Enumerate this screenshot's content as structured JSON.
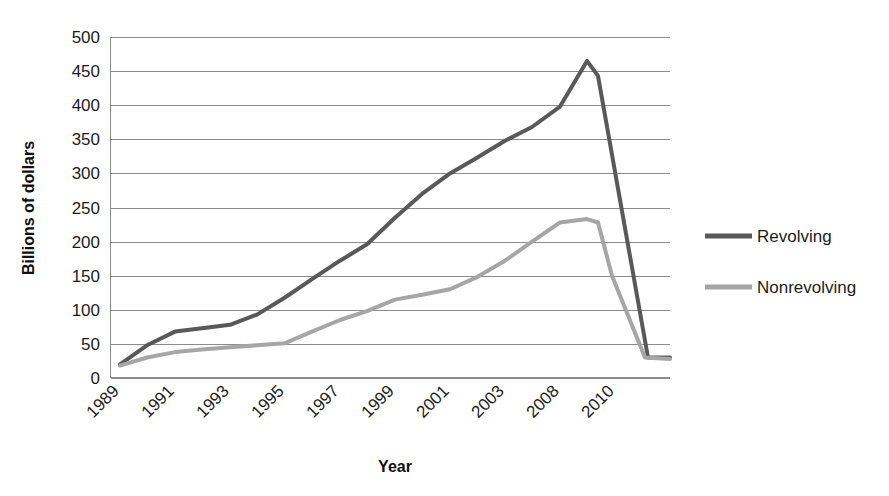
{
  "chart_data": {
    "type": "line",
    "title": "",
    "xlabel": "Year",
    "ylabel": "Billions of dollars",
    "ylim": [
      0,
      500
    ],
    "y_ticks": [
      0,
      50,
      100,
      150,
      200,
      250,
      300,
      350,
      400,
      450,
      500
    ],
    "grid": true,
    "legend_position": "right",
    "x_tick_labels": [
      "1989",
      "1991",
      "1993",
      "1995",
      "1997",
      "1999",
      "2001",
      "2003",
      "2008",
      "2010"
    ],
    "x": [
      "1989",
      "1990",
      "1991",
      "1992",
      "1993",
      "1994",
      "1995",
      "1996",
      "1997",
      "1998",
      "1999",
      "2000",
      "2001",
      "2002",
      "2003",
      "2008",
      "2009",
      "2010",
      "2011"
    ],
    "series": [
      {
        "name": "Revolving",
        "color": "#595959",
        "values": [
          20,
          48,
          68,
          73,
          78,
          93,
          118,
          145,
          172,
          196,
          235,
          270,
          300,
          323,
          348,
          368,
          398,
          465,
          443
        ]
      },
      {
        "name": "Nonrevolving",
        "color": "#a6a6a6",
        "values": [
          18,
          30,
          38,
          42,
          45,
          48,
          51,
          68,
          85,
          98,
          115,
          122,
          130,
          148,
          172,
          200,
          228,
          233,
          228
        ]
      }
    ],
    "series_tail": [
      {
        "name": "Revolving",
        "values": [
          443,
          30,
          30
        ]
      },
      {
        "name": "Nonrevolving",
        "values": [
          228,
          150,
          30,
          28
        ]
      }
    ]
  },
  "legend": {
    "entries": [
      {
        "label": "Revolving",
        "color": "#595959"
      },
      {
        "label": "Nonrevolving",
        "color": "#a6a6a6"
      }
    ]
  },
  "axes": {
    "y_title": "Billions of dollars",
    "x_title": "Year",
    "y_labels": [
      "500",
      "450",
      "400",
      "350",
      "300",
      "250",
      "200",
      "150",
      "100",
      "50",
      "0"
    ],
    "x_labels": [
      "1989",
      "1991",
      "1993",
      "1995",
      "1997",
      "1999",
      "2001",
      "2003",
      "2008",
      "2010"
    ]
  }
}
